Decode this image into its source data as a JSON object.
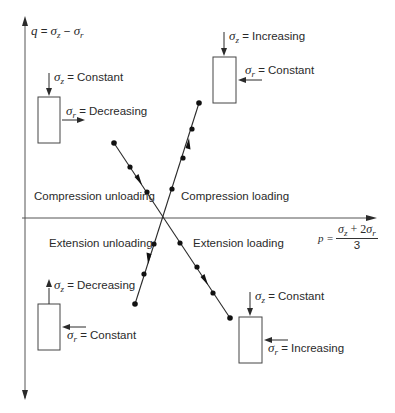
{
  "axes": {
    "q_label": {
      "lhs": "q",
      "eq": " = ",
      "a": "σ",
      "a_sub": "z",
      "minus": " − ",
      "b": "σ",
      "b_sub": "r"
    },
    "p_label": {
      "lhs": "p =",
      "num_a": "σ",
      "num_a_sub": "z",
      "plus": " + 2",
      "num_b": "σ",
      "num_b_sub": "r",
      "den": "3"
    },
    "origin": [
      163,
      218
    ],
    "vertical": {
      "x": 25,
      "y_top": 18,
      "y_bottom": 398
    },
    "horizontal": {
      "y": 218,
      "x_left": 22,
      "x_right": 375
    }
  },
  "regions": {
    "compression_unloading": "Compression unloading",
    "compression_loading": "Compression loading",
    "extension_unloading": "Extension unloading",
    "extension_loading": "Extension loading"
  },
  "paths": [
    {
      "name": "compression-loading-extension-unloading",
      "start": [
        199,
        103
      ],
      "end": [
        135,
        304
      ],
      "dots": [
        [
          199,
          103
        ],
        [
          192,
          129
        ],
        [
          183,
          158
        ],
        [
          172,
          189
        ],
        [
          154,
          244
        ],
        [
          144,
          274
        ],
        [
          135,
          304
        ]
      ],
      "arrows": [
        {
          "at": [
            188,
            144
          ],
          "dir": "up"
        },
        {
          "at": [
            149,
            259
          ],
          "dir": "down"
        }
      ]
    },
    {
      "name": "compression-unloading-extension-loading",
      "start": [
        114,
        143
      ],
      "end": [
        230,
        318
      ],
      "dots": [
        [
          114,
          143
        ],
        [
          130,
          167
        ],
        [
          147,
          192
        ],
        [
          180,
          243
        ],
        [
          197,
          267
        ],
        [
          213,
          293
        ],
        [
          230,
          318
        ]
      ],
      "arrows": [
        {
          "at": [
            139,
            180
          ],
          "dir": "down"
        },
        {
          "at": [
            205,
            280
          ],
          "dir": "down"
        }
      ]
    }
  ],
  "specimens": [
    {
      "name": "compression-unloading-specimen",
      "box": [
        38,
        97,
        22,
        46
      ],
      "sz": {
        "text": "Constant",
        "arrow": "down"
      },
      "sr": {
        "text": "Decreasing",
        "arrow": "right"
      }
    },
    {
      "name": "compression-loading-specimen",
      "box": [
        213,
        57,
        23,
        46
      ],
      "sz": {
        "text": "Increasing",
        "arrow": "down"
      },
      "sr": {
        "text": "Constant",
        "arrow": "left"
      }
    },
    {
      "name": "extension-unloading-specimen",
      "box": [
        38,
        304,
        22,
        46
      ],
      "sz": {
        "text": "Decreasing",
        "arrow": "up"
      },
      "sr": {
        "text": "Constant",
        "arrow": "left"
      }
    },
    {
      "name": "extension-loading-specimen",
      "box": [
        239,
        317,
        23,
        46
      ],
      "sz": {
        "text": "Constant",
        "arrow": "down"
      },
      "sr": {
        "text": "Increasing",
        "arrow": "left"
      }
    }
  ],
  "labels": {
    "sigma": "σ",
    "z": "z",
    "r": "r",
    "equals": " = ",
    "s1_sz": "Constant",
    "s1_sr": "Decreasing",
    "s2_sz": "Increasing",
    "s2_sr": "Constant",
    "s3_sz": "Decreasing",
    "s3_sr": "Constant",
    "s4_sz": "Constant",
    "s4_sr": "Increasing"
  },
  "colors": {
    "ink": "#2a2a2a",
    "axis": "#555555",
    "background": "#ffffff"
  }
}
